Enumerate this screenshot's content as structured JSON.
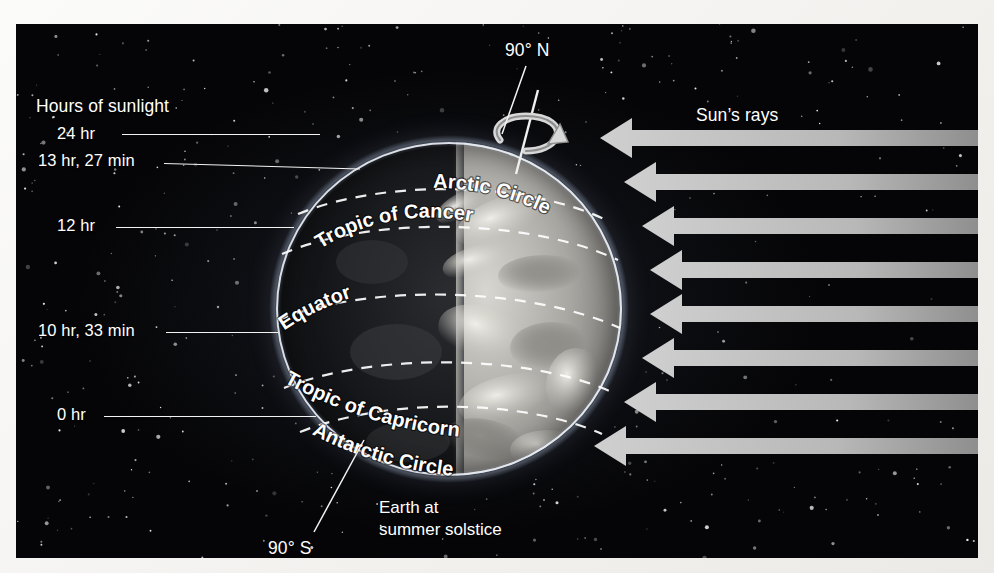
{
  "figure": {
    "background_color": "#050507",
    "arrow_color": "#b5b5b5",
    "line_color": "#f3f3f3"
  },
  "hours_panel": {
    "title": "Hours of sunlight",
    "entries": [
      {
        "label": "24 hr",
        "latitude_name": "Arctic Circle"
      },
      {
        "label": "13 hr, 27 min",
        "latitude_name": "Tropic of Cancer"
      },
      {
        "label": "12 hr",
        "latitude_name": "Equator"
      },
      {
        "label": "10 hr, 33 min",
        "latitude_name": "Tropic of Capricorn"
      },
      {
        "label": "0 hr",
        "latitude_name": "Antarctic Circle"
      }
    ]
  },
  "poles": {
    "north": "90° N",
    "south": "90° S"
  },
  "latitude_labels": [
    "Arctic Circle",
    "Tropic of Cancer",
    "Equator",
    "Tropic of Capricorn",
    "Antarctic Circle"
  ],
  "sun": {
    "rays_label": "Sun’s rays",
    "ray_count": 8
  },
  "caption": {
    "line1": "Earth at",
    "line2": "summer solstice"
  },
  "chart_data": {
    "type": "diagram",
    "title": "Earth at summer solstice",
    "categories": [
      "Arctic Circle",
      "Tropic of Cancer",
      "Equator",
      "Tropic of Capricorn",
      "Antarctic Circle"
    ],
    "series": [
      {
        "name": "Hours of sunlight",
        "values": [
          "24 hr",
          "13 hr, 27 min",
          "12 hr",
          "10 hr, 33 min",
          "0 hr"
        ]
      }
    ],
    "annotations": [
      "90° N",
      "90° S",
      "Sun’s rays",
      "Hours of sunlight"
    ]
  }
}
